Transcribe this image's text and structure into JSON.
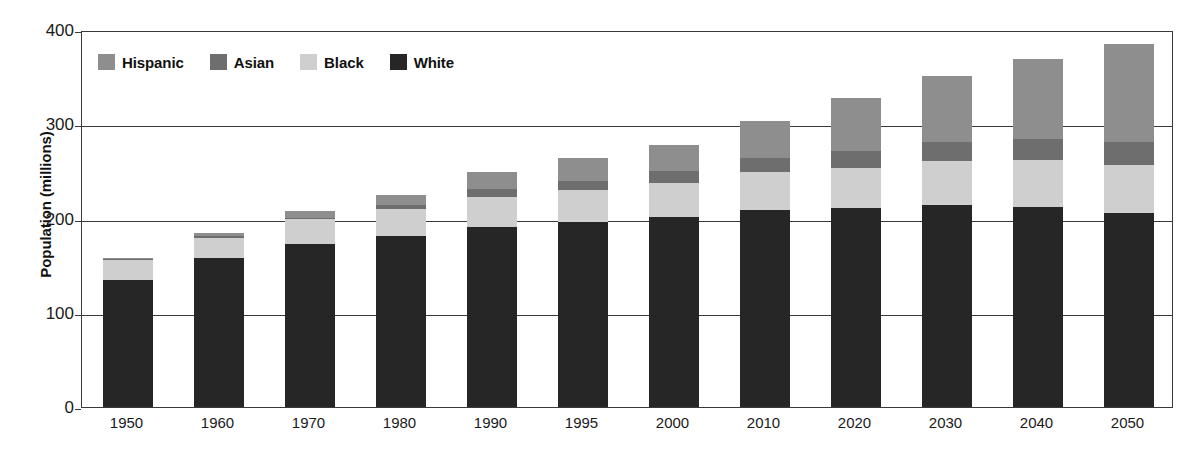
{
  "chart_data": {
    "type": "bar",
    "stacked": true,
    "title": "",
    "xlabel": "",
    "ylabel": "Population (millions)",
    "ylim": [
      0,
      400
    ],
    "yticks": [
      0,
      100,
      200,
      300,
      400
    ],
    "grid": true,
    "legend_position": "top-left",
    "categories": [
      "1950",
      "1960",
      "1970",
      "1980",
      "1990",
      "1995",
      "2000",
      "2010",
      "2020",
      "2030",
      "2040",
      "2050"
    ],
    "series": [
      {
        "name": "White",
        "color": "#262626",
        "values": [
          135,
          158,
          173,
          181,
          191,
          196,
          202,
          209,
          211,
          214,
          212,
          206
        ]
      },
      {
        "name": "Black",
        "color": "#cfcfcf",
        "values": [
          21,
          21,
          26,
          29,
          32,
          34,
          36,
          40,
          43,
          47,
          50,
          51
        ]
      },
      {
        "name": "Asian",
        "color": "#6e6e6e",
        "values": [
          1,
          2,
          2,
          4,
          8,
          10,
          12,
          15,
          18,
          20,
          22,
          24
        ]
      },
      {
        "name": "Hispanic",
        "color": "#8e8e8e",
        "values": [
          1,
          4,
          7,
          11,
          18,
          24,
          28,
          40,
          56,
          70,
          85,
          104
        ]
      }
    ],
    "totals": [
      158,
      185,
      208,
      225,
      249,
      264,
      278,
      304,
      328,
      351,
      369,
      385
    ]
  },
  "legend": {
    "items": [
      {
        "label": "Hispanic",
        "swatch": "legend-swatch-hispanic"
      },
      {
        "label": "Asian",
        "swatch": "legend-swatch-asian"
      },
      {
        "label": "Black",
        "swatch": "legend-swatch-black"
      },
      {
        "label": "White",
        "swatch": "legend-swatch-white"
      }
    ]
  },
  "axes": {
    "y_title": "Population (millions)",
    "y_labels": [
      "400",
      "300",
      "200",
      "100",
      "0"
    ],
    "x_labels": [
      "1950",
      "1960",
      "1970",
      "1980",
      "1990",
      "1995",
      "2000",
      "2010",
      "2020",
      "2030",
      "2040",
      "2050"
    ]
  }
}
